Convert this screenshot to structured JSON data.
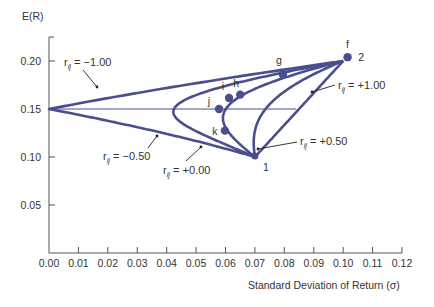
{
  "chart_data": {
    "type": "line",
    "title": "",
    "xlabel": "Standard Deviation of Return (σ)",
    "ylabel": "E(R)",
    "xlim": [
      0,
      0.12
    ],
    "ylim": [
      0,
      0.22
    ],
    "x_ticks": [
      "0.00",
      "0.01",
      "0.02",
      "0.03",
      "0.04",
      "0.05",
      "0.06",
      "0.07",
      "0.08",
      "0.09",
      "0.10",
      "0.11",
      "0.12"
    ],
    "y_ticks": [
      "0.05",
      "0.10",
      "0.15",
      "0.20"
    ],
    "grid": false,
    "colors": {
      "curve": "#4a4e8c",
      "axis": "#555555",
      "text": "#333333"
    },
    "assets": [
      {
        "label": "1",
        "sigma": 0.07,
        "er": 0.1
      },
      {
        "label": "2",
        "sigma": 0.1,
        "er": 0.2
      }
    ],
    "series": [
      {
        "name": "r_ij = +1.00",
        "correlation": 1.0,
        "label_text": "r",
        "label_sub": "ij",
        "label_value": "= +1.00"
      },
      {
        "name": "r_ij = +0.50",
        "correlation": 0.5,
        "label_text": "r",
        "label_sub": "ij",
        "label_value": "= +0.50"
      },
      {
        "name": "r_ij = +0.00",
        "correlation": 0.0,
        "label_text": "r",
        "label_sub": "ij",
        "label_value": "= +0.00"
      },
      {
        "name": "r_ij = -0.50",
        "correlation": -0.5,
        "label_text": "r",
        "label_sub": "ij",
        "label_value": "= −0.50"
      },
      {
        "name": "r_ij = -1.00",
        "correlation": -1.0,
        "label_text": "r",
        "label_sub": "ij",
        "label_value": "= −1.00"
      }
    ],
    "reference_line": {
      "er": 0.15,
      "from_sigma": 0.0,
      "to_sigma": 0.084
    },
    "points": [
      {
        "label": "f",
        "sigma": 0.1015,
        "er": 0.204
      },
      {
        "label": "g",
        "sigma": 0.0795,
        "er": 0.186
      },
      {
        "label": "h",
        "sigma": 0.065,
        "er": 0.165
      },
      {
        "label": "i",
        "sigma": 0.0612,
        "er": 0.1615
      },
      {
        "label": "j",
        "sigma": 0.0578,
        "er": 0.15
      },
      {
        "label": "k",
        "sigma": 0.0598,
        "er": 0.1275
      }
    ]
  }
}
